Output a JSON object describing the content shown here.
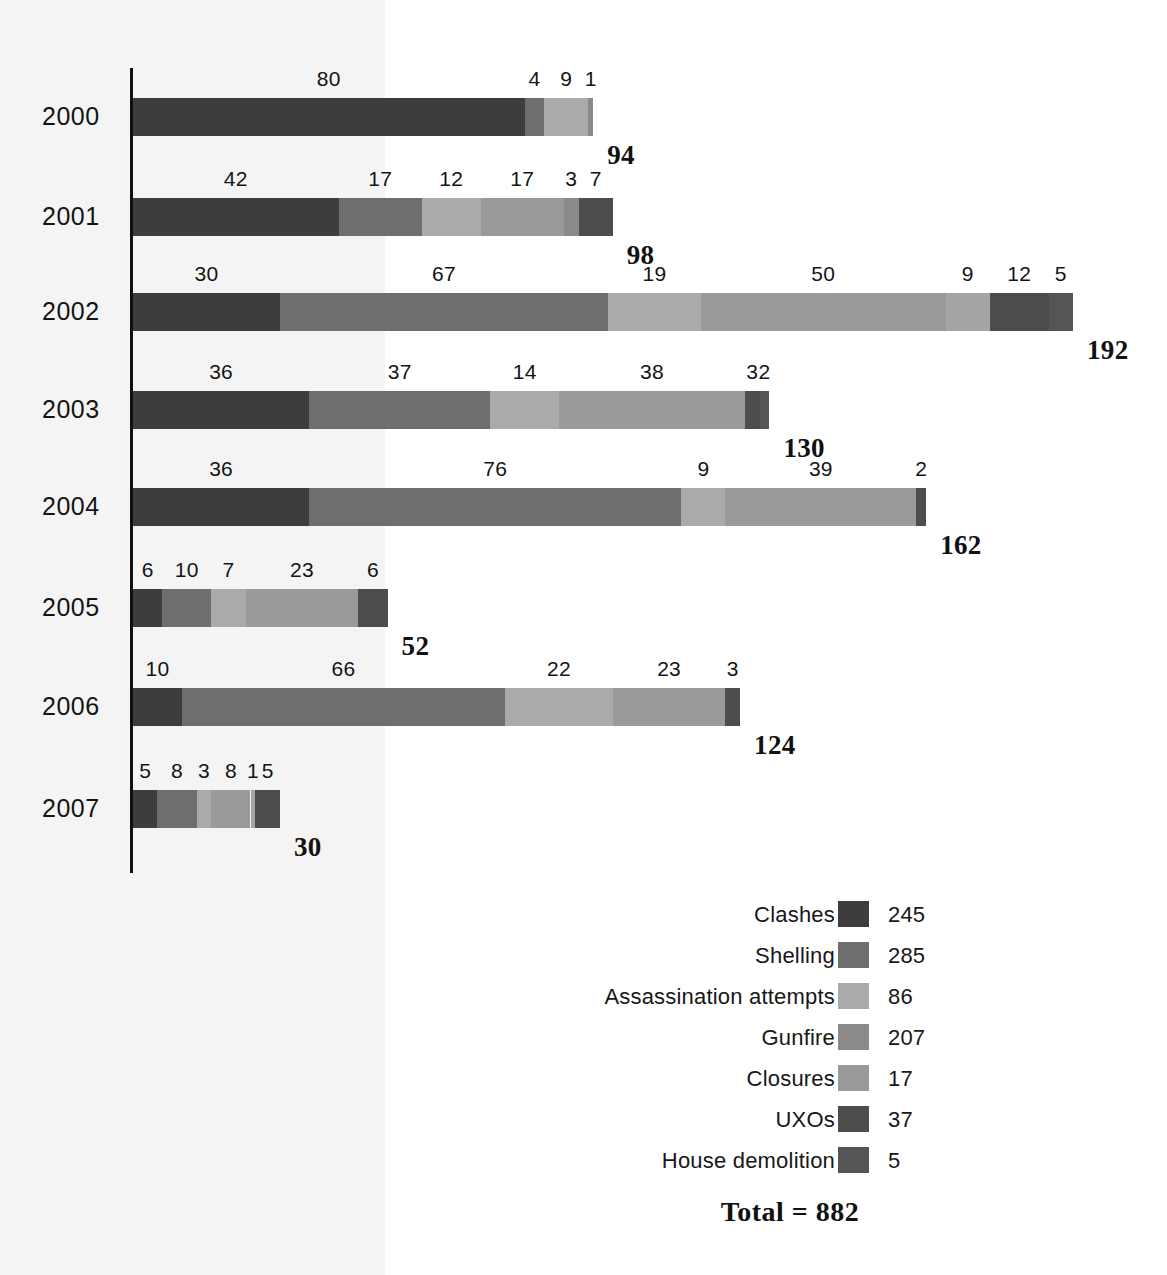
{
  "chart_data": {
    "type": "bar",
    "orientation": "horizontal",
    "stacked": true,
    "title": "",
    "xlabel": "",
    "ylabel": "",
    "grid": false,
    "legend_position": "bottom-right",
    "categories": [
      "2000",
      "2001",
      "2002",
      "2003",
      "2004",
      "2005",
      "2006",
      "2007"
    ],
    "series": [
      {
        "name": "Clashes",
        "values": [
          80,
          42,
          30,
          36,
          36,
          6,
          10,
          5
        ],
        "color": "#3d3d3d",
        "total": 245
      },
      {
        "name": "Shelling",
        "values": [
          0,
          17,
          67,
          37,
          76,
          10,
          66,
          8
        ],
        "color": "#6e6e6e",
        "total": 285
      },
      {
        "name": "Assassination attempts",
        "values": [
          4,
          12,
          19,
          14,
          9,
          7,
          0,
          3
        ],
        "color": "#aaaaaa",
        "total": 86
      },
      {
        "name": "Gunfire",
        "values": [
          9,
          17,
          50,
          38,
          39,
          23,
          22,
          8
        ],
        "color": "#8a8a8a",
        "total": 207
      },
      {
        "name": "Closures",
        "values": [
          0,
          3,
          9,
          0,
          0,
          0,
          23,
          1
        ],
        "color": "#9a9a9a",
        "total": 17
      },
      {
        "name": "UXOs",
        "values": [
          1,
          7,
          12,
          3,
          2,
          6,
          3,
          5
        ],
        "color": "#4d4d4d",
        "total": 37
      },
      {
        "name": "House demolition",
        "values": [
          0,
          0,
          5,
          2,
          0,
          0,
          0,
          0
        ],
        "color": "#555555",
        "total": 5
      }
    ],
    "row_totals": [
      94,
      98,
      192,
      130,
      162,
      52,
      124,
      30
    ],
    "grand_total": 882,
    "xlim": [
      0,
      192
    ]
  },
  "rows": [
    {
      "year": "2000",
      "total": "94",
      "segments": [
        {
          "label": "80",
          "value": 80,
          "series": "Clashes",
          "color": "#3d3d3d"
        },
        {
          "label": "4",
          "value": 4,
          "series": "Assassination attempts",
          "color": "#6e6e6e"
        },
        {
          "label": "9",
          "value": 9,
          "series": "Gunfire",
          "color": "#aaaaaa"
        },
        {
          "label": "1",
          "value": 1,
          "series": "UXOs",
          "color": "#8a8a8a"
        }
      ]
    },
    {
      "year": "2001",
      "total": "98",
      "segments": [
        {
          "label": "42",
          "value": 42,
          "series": "Clashes",
          "color": "#3d3d3d"
        },
        {
          "label": "17",
          "value": 17,
          "series": "Shelling",
          "color": "#6e6e6e"
        },
        {
          "label": "12",
          "value": 12,
          "series": "Assassination attempts",
          "color": "#aaaaaa"
        },
        {
          "label": "17",
          "value": 17,
          "series": "Gunfire",
          "color": "#9a9a9a"
        },
        {
          "label": "3",
          "value": 3,
          "series": "Closures",
          "color": "#8a8a8a"
        },
        {
          "label": "7",
          "value": 7,
          "series": "UXOs",
          "color": "#4d4d4d"
        }
      ]
    },
    {
      "year": "2002",
      "total": "192",
      "segments": [
        {
          "label": "30",
          "value": 30,
          "series": "Clashes",
          "color": "#3d3d3d"
        },
        {
          "label": "67",
          "value": 67,
          "series": "Shelling",
          "color": "#6e6e6e"
        },
        {
          "label": "19",
          "value": 19,
          "series": "Assassination attempts",
          "color": "#aaaaaa"
        },
        {
          "label": "50",
          "value": 50,
          "series": "Gunfire",
          "color": "#9a9a9a"
        },
        {
          "label": "9",
          "value": 9,
          "series": "Closures",
          "color": "#a4a4a4"
        },
        {
          "label": "12",
          "value": 12,
          "series": "UXOs",
          "color": "#4d4d4d"
        },
        {
          "label": "5",
          "value": 5,
          "series": "House demolition",
          "color": "#555555"
        }
      ]
    },
    {
      "year": "2003",
      "total": "130",
      "segments": [
        {
          "label": "36",
          "value": 36,
          "series": "Clashes",
          "color": "#3d3d3d"
        },
        {
          "label": "37",
          "value": 37,
          "series": "Shelling",
          "color": "#6e6e6e"
        },
        {
          "label": "14",
          "value": 14,
          "series": "Assassination attempts",
          "color": "#aaaaaa"
        },
        {
          "label": "38",
          "value": 38,
          "series": "Gunfire",
          "color": "#9a9a9a"
        },
        {
          "label": "3",
          "value": 3,
          "series": "UXOs",
          "color": "#4d4d4d"
        },
        {
          "label": "2",
          "value": 2,
          "series": "House demolition",
          "color": "#555555"
        }
      ]
    },
    {
      "year": "2004",
      "total": "162",
      "segments": [
        {
          "label": "36",
          "value": 36,
          "series": "Clashes",
          "color": "#3d3d3d"
        },
        {
          "label": "76",
          "value": 76,
          "series": "Shelling",
          "color": "#6e6e6e"
        },
        {
          "label": "9",
          "value": 9,
          "series": "Assassination attempts",
          "color": "#aaaaaa"
        },
        {
          "label": "39",
          "value": 39,
          "series": "Gunfire",
          "color": "#9a9a9a"
        },
        {
          "label": "2",
          "value": 2,
          "series": "UXOs",
          "color": "#4d4d4d"
        }
      ]
    },
    {
      "year": "2005",
      "total": "52",
      "segments": [
        {
          "label": "6",
          "value": 6,
          "series": "Clashes",
          "color": "#3d3d3d"
        },
        {
          "label": "10",
          "value": 10,
          "series": "Shelling",
          "color": "#6e6e6e"
        },
        {
          "label": "7",
          "value": 7,
          "series": "Assassination attempts",
          "color": "#aaaaaa"
        },
        {
          "label": "23",
          "value": 23,
          "series": "Gunfire",
          "color": "#9a9a9a"
        },
        {
          "label": "6",
          "value": 6,
          "series": "UXOs",
          "color": "#4d4d4d"
        }
      ]
    },
    {
      "year": "2006",
      "total": "124",
      "segments": [
        {
          "label": "10",
          "value": 10,
          "series": "Clashes",
          "color": "#3d3d3d"
        },
        {
          "label": "66",
          "value": 66,
          "series": "Shelling",
          "color": "#6e6e6e"
        },
        {
          "label": "22",
          "value": 22,
          "series": "Assassination attempts",
          "color": "#aaaaaa"
        },
        {
          "label": "23",
          "value": 23,
          "series": "Closures",
          "color": "#9a9a9a"
        },
        {
          "label": "3",
          "value": 3,
          "series": "UXOs",
          "color": "#4d4d4d"
        }
      ]
    },
    {
      "year": "2007",
      "total": "30",
      "segments": [
        {
          "label": "5",
          "value": 5,
          "series": "Clashes",
          "color": "#3d3d3d"
        },
        {
          "label": "8",
          "value": 8,
          "series": "Shelling",
          "color": "#6e6e6e"
        },
        {
          "label": "3",
          "value": 3,
          "series": "Assassination attempts",
          "color": "#aaaaaa"
        },
        {
          "label": "8",
          "value": 8,
          "series": "Gunfire",
          "color": "#9a9a9a"
        },
        {
          "label": "1",
          "value": 1,
          "series": "Closures",
          "color": "#a4a4a4"
        },
        {
          "label": "5",
          "value": 5,
          "series": "UXOs",
          "color": "#4d4d4d"
        }
      ]
    }
  ],
  "legend": {
    "items": [
      {
        "label": "Clashes",
        "count": "245",
        "color": "#3d3d3d"
      },
      {
        "label": "Shelling",
        "count": "285",
        "color": "#6e6e6e"
      },
      {
        "label": "Assassination attempts",
        "count": "86",
        "color": "#aaaaaa"
      },
      {
        "label": "Gunfire",
        "count": "207",
        "color": "#8a8a8a"
      },
      {
        "label": "Closures",
        "count": "17",
        "color": "#9a9a9a"
      },
      {
        "label": "UXOs",
        "count": "37",
        "color": "#4d4d4d"
      },
      {
        "label": "House demolition",
        "count": "5",
        "color": "#555555"
      }
    ],
    "total_text": "Total = 882"
  }
}
